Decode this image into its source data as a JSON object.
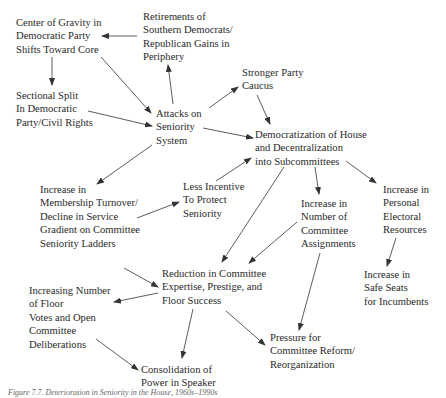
{
  "nodes": {
    "center_gravity": "Center of Gravity in\nDemocratic Party\nShifts Toward Core",
    "retirements": "Retirements of\nSouthern Democrats/\nRepublican Gains in\nPeriphery",
    "sectional_split": "Sectional Split\nIn Democratic\nParty/Civil Rights",
    "attacks": "Attacks on\nSeniority\nSystem",
    "stronger_caucus": "Stronger Party\nCaucus",
    "democratization": "Democratization of House\nand Decentralization\ninto Subcommittees",
    "membership_turnover": "Increase in\nMembership Turnover/\nDecline in Service\nGradient on Committee\nSeniority Ladders",
    "less_incentive": "Less Incentive\nTo Protect\nSeniority",
    "committee_assignments": "Increase in\nNumber of\nCommittee\nAssignments",
    "electoral_resources": "Increase in\nPersonal\nElectoral\nResources",
    "safe_seats": "Increase in\nSafe Seats\nfor Incumbents",
    "reduction": "Reduction in Committee\nExpertise, Prestige, and\nFloor Success",
    "floor_votes": "Increasing Number\nof Floor\nVotes and Open\nCommittee\nDeliberations",
    "pressure_reform": "Pressure for\nCommittee Reform/\nReorganization",
    "consolidation": "Consolidation of\nPower in Speaker"
  },
  "caption": "Figure 7.7. Deterioration in Seniority in the House, 1960s–1990s",
  "colors": {
    "text": "#2a2a2a",
    "arrow": "#333333"
  }
}
